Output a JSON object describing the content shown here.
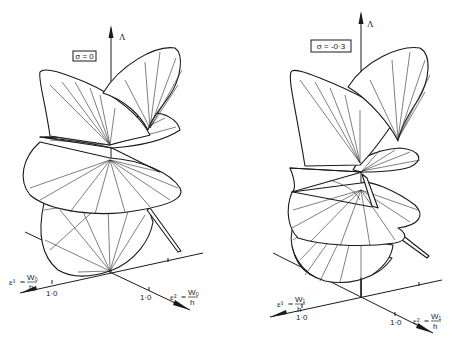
{
  "figure": {
    "panels": [
      {
        "id": "left",
        "parameter_label": "σ = 0",
        "vertical_axis_label": "Λ",
        "axis1": {
          "label_symbol": "ε¹",
          "label_numerator": "W₀",
          "label_denominator": "h",
          "tick_label": "1·0"
        },
        "axis2": {
          "label_symbol": "ε²",
          "label_numerator": "W₀",
          "label_denominator": "h",
          "tick_label": "1·0"
        }
      },
      {
        "id": "right",
        "parameter_label": "σ = -0·3",
        "vertical_axis_label": "Λ",
        "axis1": {
          "label_symbol": "ε¹",
          "label_numerator": "W₁",
          "label_denominator": "h",
          "tick_label": "1·0"
        },
        "axis2": {
          "label_symbol": "ε²",
          "label_numerator": "W₁",
          "label_denominator": "h",
          "tick_label": "1·0"
        }
      }
    ],
    "colors": {
      "ink": "#1a1a1a",
      "background": "#ffffff"
    }
  }
}
